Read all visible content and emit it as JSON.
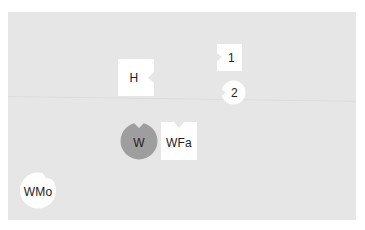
{
  "board": {
    "background": "#e6e6e6"
  },
  "pieces": [
    {
      "id": "H",
      "label": "H",
      "shape": "square",
      "notch": "right",
      "fill": "#ffffff"
    },
    {
      "id": "1",
      "label": "1",
      "shape": "square",
      "notch": "left",
      "fill": "#ffffff"
    },
    {
      "id": "2",
      "label": "2",
      "shape": "circle",
      "notch": "left",
      "fill": "#ffffff"
    },
    {
      "id": "W",
      "label": "W",
      "shape": "circle",
      "notch": "top",
      "fill": "#9e9e9e"
    },
    {
      "id": "WFa",
      "label": "WFa",
      "shape": "square",
      "notch": "top",
      "fill": "#ffffff"
    },
    {
      "id": "WMo",
      "label": "WMo",
      "shape": "circle",
      "notch": "top-right",
      "fill": "#ffffff"
    }
  ]
}
